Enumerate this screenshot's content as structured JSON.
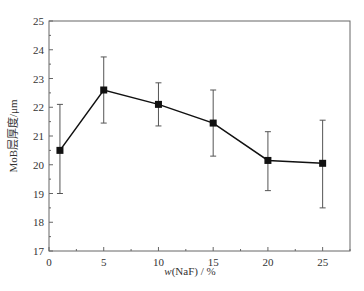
{
  "chart_data": {
    "type": "line",
    "title": "",
    "xlabel": "w(NaF)/%",
    "xlabel_italic_prefix": "w",
    "xlabel_rest": "(NaF) / %",
    "ylabel": "MoB层厚度/μm",
    "xlim": [
      0,
      27.5
    ],
    "ylim": [
      17,
      25
    ],
    "xticks": [
      0,
      5,
      10,
      15,
      20,
      25
    ],
    "yticks": [
      17,
      18,
      19,
      20,
      21,
      22,
      23,
      24,
      25
    ],
    "grid": false,
    "legend": null,
    "series": [
      {
        "name": "MoB layer thickness",
        "marker": "square",
        "color": "#111111",
        "x": [
          1,
          5,
          10,
          15,
          20,
          25
        ],
        "y": [
          20.5,
          22.6,
          22.1,
          21.45,
          20.15,
          20.05
        ],
        "error_upper": [
          22.1,
          23.75,
          22.85,
          22.6,
          21.15,
          21.55
        ],
        "error_lower": [
          19.0,
          21.45,
          21.35,
          20.3,
          19.1,
          18.5
        ]
      }
    ]
  }
}
